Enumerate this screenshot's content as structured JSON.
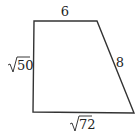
{
  "diagram": {
    "type": "trapezoid",
    "stroke_color": "#333333",
    "vertices": {
      "top_left": [
        34,
        21
      ],
      "top_right": [
        97,
        21
      ],
      "bottom_right": [
        134,
        113
      ],
      "bottom_left": [
        33,
        112
      ]
    },
    "sides": {
      "top": {
        "label": "6"
      },
      "right": {
        "label": "8"
      },
      "bottom": {
        "label": "72",
        "radical": true
      },
      "left": {
        "label": "50",
        "radical": true
      }
    }
  }
}
